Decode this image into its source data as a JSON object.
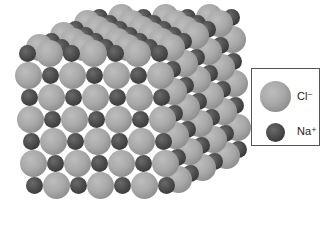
{
  "figure": {
    "lattice": {
      "front_rows": 7,
      "front_cols": 7,
      "depth_layers": 7,
      "spacing_px": 22,
      "origin": {
        "x": 27,
        "y": 53
      },
      "depth_offset": {
        "dx": 12,
        "dy": -6
      },
      "shear_per_row": 1.2
    }
  },
  "legend": {
    "items": [
      {
        "ion": "Cl",
        "charge": "−",
        "label": "Cl⁻",
        "size": "large",
        "color": "#a8a8a8"
      },
      {
        "ion": "Na",
        "charge": "+",
        "label": "Na⁺",
        "size": "small",
        "color": "#3c3c3c"
      }
    ]
  }
}
